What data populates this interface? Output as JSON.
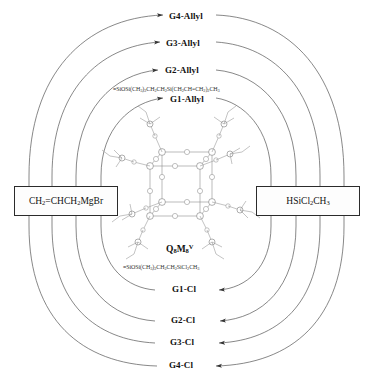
{
  "diagram": {
    "line_color": "#555555",
    "text_color": "#111111",
    "box_border_color": "#2b2b2b"
  },
  "reagents": {
    "left": {
      "name": "allyl-grignard-reagent",
      "formula_html": "CH<sub>2</sub>=CHCH<sub>2</sub>MgBr",
      "formula_text": "CH2=CHCH2MgBr"
    },
    "right": {
      "name": "dichloromethylsilane-reagent",
      "formula_html": "HSiCl<sub>2</sub>CH<sub>3</sub>",
      "formula_text": "HSiCl2CH3"
    }
  },
  "core": {
    "label_html": "Q<sub>8</sub>M<sub>8</sub><sup>V</sup>",
    "label_text": "Q8M8V"
  },
  "intermediate_formulas": {
    "allyl_html": "&#8801;SiOSi(CH<sub>3</sub>)<sub>2</sub>CH<sub>2</sub>CH<sub>2</sub>Si(CH<sub>2</sub>CH=CH<sub>2</sub>)<sub>2</sub>CH<sub>3</sub>",
    "allyl_text": "≡SiOSi(CH3)2CH2CH2Si(CH2CH=CH2)2CH3",
    "chloro_html": "&#8801;SiOSi(CH<sub>3</sub>)<sub>2</sub>CH<sub>2</sub>CH<sub>2</sub>SiCl<sub>2</sub>CH<sub>3</sub>",
    "chloro_text": "≡SiOSi(CH3)2CH2CH2SiCl2CH3"
  },
  "allyl_generations": [
    {
      "id": "g1-allyl",
      "label": "G1-Allyl"
    },
    {
      "id": "g2-allyl",
      "label": "G2-Allyl"
    },
    {
      "id": "g3-allyl",
      "label": "G3-Allyl"
    },
    {
      "id": "g4-allyl",
      "label": "G4-Allyl"
    }
  ],
  "chloro_generations": [
    {
      "id": "g1-cl",
      "label": "G1-Cl"
    },
    {
      "id": "g2-cl",
      "label": "G2-Cl"
    },
    {
      "id": "g3-cl",
      "label": "G3-Cl"
    },
    {
      "id": "g4-cl",
      "label": "G4-Cl"
    }
  ]
}
